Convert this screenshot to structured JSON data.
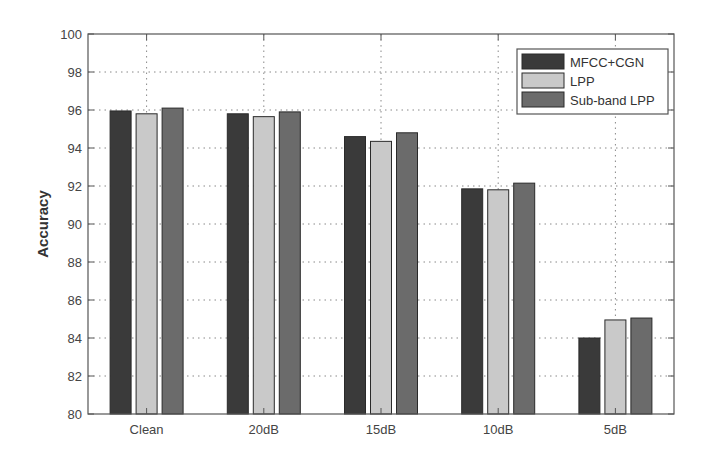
{
  "chart_data": {
    "type": "bar",
    "title": "",
    "xlabel": "",
    "ylabel": "Accuracy",
    "ylim": [
      80,
      100
    ],
    "yticks": [
      80,
      82,
      84,
      86,
      88,
      90,
      92,
      94,
      96,
      98,
      100
    ],
    "grid": true,
    "legend_position": "upper right",
    "categories": [
      "Clean",
      "20dB",
      "15dB",
      "10dB",
      "5dB"
    ],
    "series": [
      {
        "name": "MFCC+CGN",
        "color": "#3a3a3a",
        "values": [
          95.95,
          95.8,
          94.6,
          91.85,
          84.0
        ]
      },
      {
        "name": "LPP",
        "color": "#c9c9c9",
        "values": [
          95.8,
          95.65,
          94.35,
          91.8,
          84.95
        ]
      },
      {
        "name": "Sub-band LPP",
        "color": "#6b6b6b",
        "values": [
          96.1,
          95.9,
          94.8,
          92.15,
          85.05
        ]
      }
    ]
  }
}
